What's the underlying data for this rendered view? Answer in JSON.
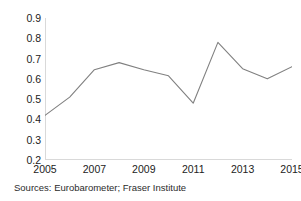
{
  "chart_data": {
    "type": "line",
    "title": "",
    "subtitle": "",
    "xlabel": "",
    "ylabel": "",
    "x": [
      2005,
      2006,
      2007,
      2008,
      2009,
      2010,
      2011,
      2012,
      2013,
      2014,
      2015
    ],
    "values": [
      0.42,
      0.51,
      0.645,
      0.68,
      0.645,
      0.615,
      0.48,
      0.78,
      0.65,
      0.6,
      0.66
    ],
    "series": [
      {
        "name": "",
        "values": [
          0.42,
          0.51,
          0.645,
          0.68,
          0.645,
          0.615,
          0.48,
          0.78,
          0.65,
          0.6,
          0.66
        ]
      }
    ],
    "xlim": [
      2005,
      2015
    ],
    "ylim": [
      0.2,
      0.9
    ],
    "y_ticks": [
      "0.9",
      "0.8",
      "0.7",
      "0.6",
      "0.5",
      "0.4",
      "0.3",
      "0.2"
    ],
    "y_tick_values": [
      0.9,
      0.8,
      0.7,
      0.6,
      0.5,
      0.4,
      0.3,
      0.2
    ],
    "x_ticks": [
      "2005",
      "2007",
      "2009",
      "2011",
      "2013",
      "2015"
    ],
    "x_tick_values": [
      2005,
      2007,
      2009,
      2011,
      2013,
      2015
    ],
    "grid": false,
    "legend": false,
    "legend_position": "none",
    "line_color": "#808080",
    "axis_color": "#d9d9d9",
    "background_color": "#ffffff",
    "annotations": []
  },
  "caption": {
    "source_note": "Sources: Eurobarometer; Fraser Institute"
  }
}
